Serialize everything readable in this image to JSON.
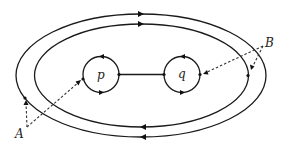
{
  "diagram": {
    "type": "topology-paths",
    "labels": {
      "point_p": "p",
      "point_q": "q",
      "callout_a": "A",
      "callout_b": "B"
    },
    "elements": [
      {
        "id": "outer-loop",
        "shape": "ellipse",
        "orientation": "clockwise"
      },
      {
        "id": "inner-loop",
        "shape": "ellipse",
        "orientation": "clockwise"
      },
      {
        "id": "loop-p",
        "shape": "circle",
        "center_label": "p",
        "orientation": "counterclockwise"
      },
      {
        "id": "loop-q",
        "shape": "circle",
        "center_label": "q",
        "orientation": "counterclockwise"
      },
      {
        "id": "segment-pq",
        "shape": "line",
        "connects": [
          "p",
          "q"
        ]
      }
    ],
    "callouts": [
      {
        "label": "A",
        "points_to": [
          "outer-loop",
          "loop-p"
        ]
      },
      {
        "label": "B",
        "points_to": [
          "loop-q",
          "inner-loop"
        ]
      }
    ],
    "colors": {
      "stroke": "#1a1a1a",
      "background": "#ffffff"
    }
  }
}
